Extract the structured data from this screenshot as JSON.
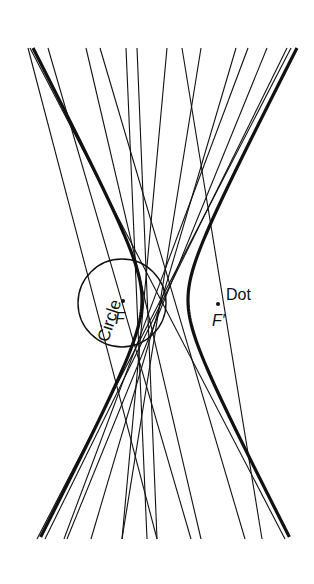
{
  "figure": {
    "width": 314,
    "height": 584,
    "background": "#ffffff",
    "ink": "#111111"
  },
  "hyperbola": {
    "center": [
      165,
      300
    ],
    "a": 23,
    "b": 44.6,
    "y_range": [
      48,
      539
    ],
    "stroke_width": 3.2
  },
  "circle": {
    "label": "Circle",
    "center": [
      122,
      303
    ],
    "radius": 44,
    "focus_label": "F",
    "focus_point": [
      123,
      301
    ]
  },
  "dot": {
    "label": "Dot",
    "focus_label": "F′",
    "focus_point": [
      218,
      304
    ]
  },
  "lines": [
    {
      "x1": 28,
      "y1": 48,
      "x2": 157,
      "y2": 539
    },
    {
      "x1": 48,
      "y1": 48,
      "x2": 191,
      "y2": 539
    },
    {
      "x1": 86,
      "y1": 48,
      "x2": 201,
      "y2": 539
    },
    {
      "x1": 100,
      "y1": 48,
      "x2": 245,
      "y2": 539
    },
    {
      "x1": 126,
      "y1": 48,
      "x2": 147,
      "y2": 539
    },
    {
      "x1": 137,
      "y1": 48,
      "x2": 157,
      "y2": 539
    },
    {
      "x1": 167,
      "y1": 48,
      "x2": 122,
      "y2": 539
    },
    {
      "x1": 182,
      "y1": 48,
      "x2": 262,
      "y2": 539
    },
    {
      "x1": 201,
      "y1": 48,
      "x2": 122,
      "y2": 539
    },
    {
      "x1": 236,
      "y1": 48,
      "x2": 91,
      "y2": 539
    },
    {
      "x1": 248,
      "y1": 48,
      "x2": 64,
      "y2": 539
    },
    {
      "x1": 267,
      "y1": 48,
      "x2": 67,
      "y2": 539
    },
    {
      "x1": 287,
      "y1": 48,
      "x2": 45,
      "y2": 539
    },
    {
      "x1": 291,
      "y1": 48,
      "x2": 37,
      "y2": 539
    },
    {
      "x1": 30,
      "y1": 48,
      "x2": 285,
      "y2": 539
    }
  ]
}
